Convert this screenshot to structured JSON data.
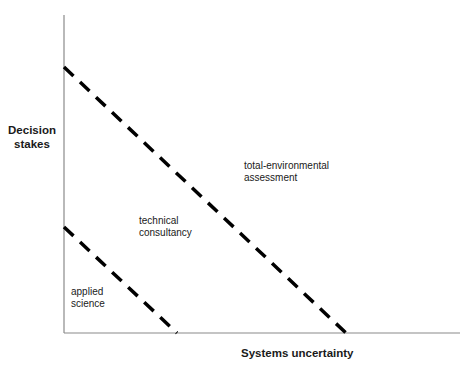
{
  "diagram": {
    "y_axis_label": "Decision\nstakes",
    "x_axis_label": "Systems uncertainty",
    "regions": [
      {
        "id": "applied-science",
        "label": "applied\nscience"
      },
      {
        "id": "technical-consultancy",
        "label": "technical\nconsultancy"
      },
      {
        "id": "total-environmental-assessment",
        "label": "total-environmental\nassessment"
      }
    ],
    "boundaries": [
      {
        "name": "applied-science / technical-consultancy boundary",
        "style": "dashed"
      },
      {
        "name": "technical-consultancy / total-environmental-assessment boundary",
        "style": "dashed"
      }
    ],
    "colors": {
      "axis": "#888888",
      "dash": "#000000",
      "text": "#1a1a1a"
    }
  }
}
